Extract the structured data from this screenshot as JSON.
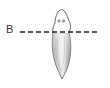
{
  "diagram": {
    "cut_line_label": "B",
    "elements": [
      "head with two eyespots",
      "tapered body",
      "dashed cut line"
    ]
  }
}
